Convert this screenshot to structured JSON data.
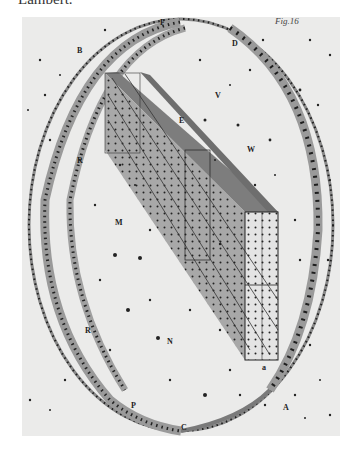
{
  "caption": "Lambert.",
  "figure": {
    "number_label": "Fig.16",
    "labels": [
      {
        "text": "B",
        "x": 77,
        "y": 53
      },
      {
        "text": "F",
        "x": 160,
        "y": 25
      },
      {
        "text": "D",
        "x": 232,
        "y": 46
      },
      {
        "text": "V",
        "x": 215,
        "y": 98
      },
      {
        "text": "E",
        "x": 179,
        "y": 123
      },
      {
        "text": "W",
        "x": 247,
        "y": 152
      },
      {
        "text": "R",
        "x": 77,
        "y": 163
      },
      {
        "text": "M",
        "x": 115,
        "y": 225
      },
      {
        "text": "R",
        "x": 85,
        "y": 333
      },
      {
        "text": "N",
        "x": 167,
        "y": 344
      },
      {
        "text": "P",
        "x": 131,
        "y": 408
      },
      {
        "text": "C",
        "x": 181,
        "y": 430
      },
      {
        "text": "A",
        "x": 283,
        "y": 410
      },
      {
        "text": "a",
        "x": 262,
        "y": 370
      }
    ]
  },
  "colors": {
    "paper": "#ebebea",
    "ink": "#1e1e1e",
    "band": "#8a8a8a",
    "slab_dark": "#7d7d7d",
    "slab_mid": "#a8a8a8",
    "slab_light": "#e4e4e4"
  }
}
